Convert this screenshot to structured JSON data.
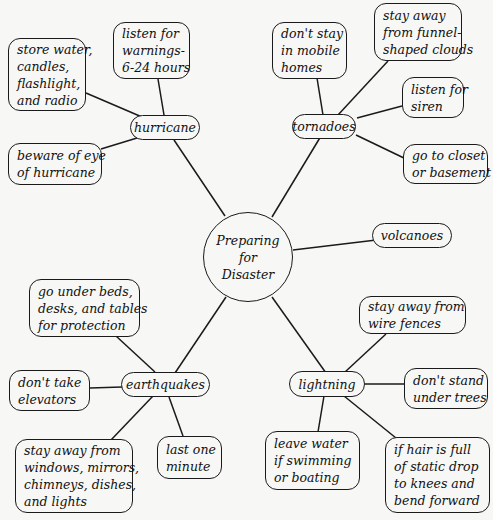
{
  "center": {
    "lines": [
      "Preparing",
      "for",
      "Disaster"
    ]
  },
  "branches": {
    "hurricane": {
      "label": "hurricane",
      "items": [
        {
          "lines": [
            "store water,",
            "candles,",
            "flashlight,",
            "and radio"
          ]
        },
        {
          "lines": [
            "listen for",
            "warnings-",
            "6-24 hours"
          ]
        },
        {
          "lines": [
            "beware of eye",
            "of hurricane"
          ]
        }
      ]
    },
    "tornadoes": {
      "label": "tornadoes",
      "items": [
        {
          "lines": [
            "don't stay",
            "in mobile",
            "homes"
          ]
        },
        {
          "lines": [
            "stay away",
            "from funnel-",
            "shaped clouds"
          ]
        },
        {
          "lines": [
            "listen for",
            "siren"
          ]
        },
        {
          "lines": [
            "go to closet",
            "or basement"
          ]
        }
      ]
    },
    "volcanoes": {
      "label": "volcanoes",
      "items": []
    },
    "earthquakes": {
      "label": "earthquakes",
      "items": [
        {
          "lines": [
            "go under beds,",
            "desks, and tables",
            "for protection"
          ]
        },
        {
          "lines": [
            "don't take",
            "elevators"
          ]
        },
        {
          "lines": [
            "stay away from",
            "windows, mirrors,",
            "chimneys, dishes,",
            "and lights"
          ]
        },
        {
          "lines": [
            "last one",
            "minute"
          ]
        }
      ]
    },
    "lightning": {
      "label": "lightning",
      "items": [
        {
          "lines": [
            "stay away from",
            "wire fences"
          ]
        },
        {
          "lines": [
            "don't stand",
            "under trees"
          ]
        },
        {
          "lines": [
            "leave water",
            "if swimming",
            "or boating"
          ]
        },
        {
          "lines": [
            "if hair is full",
            "of static drop",
            "to knees and",
            "bend forward"
          ]
        }
      ]
    }
  },
  "colors": {
    "line": "#1a1a1a",
    "background": "#f7f7f5"
  }
}
